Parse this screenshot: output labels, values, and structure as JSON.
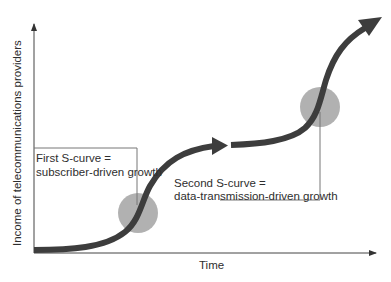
{
  "axes": {
    "y_label": "Income of  telecommunications providers",
    "x_label": "Time"
  },
  "annotations": [
    {
      "line1": "First S-curve =",
      "line2": "subscriber-driven growth"
    },
    {
      "line1": "Second S-curve =",
      "line2": "data-transmission-driven growth"
    }
  ],
  "colors": {
    "curve": "#3d3d3d",
    "circle": "#a9a9a9",
    "axis": "#444444",
    "callout": "#666666"
  }
}
